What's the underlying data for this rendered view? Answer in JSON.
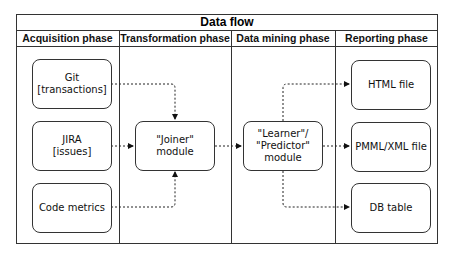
{
  "title": "Data flow",
  "phases": [
    {
      "label": "Acquisition phase"
    },
    {
      "label": "Transformation phase"
    },
    {
      "label": "Data mining phase"
    },
    {
      "label": "Reporting phase"
    }
  ],
  "nodes": {
    "git": "Git\n[transactions]",
    "jira": "JIRA\n[issues]",
    "code_metrics": "Code metrics",
    "joiner": "\"Joiner\"\nmodule",
    "learner": "\"Learner\"/\n\"Predictor\"\nmodule",
    "html_file": "HTML file",
    "pmml_file": "PMML/XML file",
    "db_table": "DB table"
  },
  "edges": [
    {
      "from": "git",
      "to": "joiner",
      "style": "dashed"
    },
    {
      "from": "jira",
      "to": "joiner",
      "style": "dashed"
    },
    {
      "from": "code_metrics",
      "to": "joiner",
      "style": "dashed"
    },
    {
      "from": "joiner",
      "to": "learner",
      "style": "dashed"
    },
    {
      "from": "learner",
      "to": "html_file",
      "style": "dashed"
    },
    {
      "from": "learner",
      "to": "pmml_file",
      "style": "dashed"
    },
    {
      "from": "learner",
      "to": "db_table",
      "style": "dashed"
    }
  ]
}
